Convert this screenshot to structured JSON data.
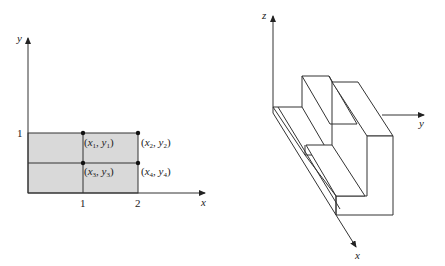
{
  "left_diagram": {
    "axis_x_label": "x",
    "axis_y_label": "y",
    "x_ticks": [
      "1",
      "2"
    ],
    "y_ticks": [
      "1"
    ],
    "points": [
      {
        "label": "(x1, y1)",
        "var": "x",
        "sub1": "1",
        "var2": "y",
        "sub2": "1"
      },
      {
        "label": "(x2, y2)",
        "var": "x",
        "sub1": "2",
        "var2": "y",
        "sub2": "2"
      },
      {
        "label": "(x3, y3)",
        "var": "x",
        "sub1": "3",
        "var2": "y",
        "sub2": "3"
      },
      {
        "label": "(x4, y4)",
        "var": "x",
        "sub1": "4",
        "var2": "y",
        "sub2": "4"
      }
    ],
    "fill_color": "#d9d9d9",
    "line_color": "#333333"
  },
  "right_diagram": {
    "axis_x_label": "x",
    "axis_y_label": "y",
    "axis_z_label": "z"
  }
}
